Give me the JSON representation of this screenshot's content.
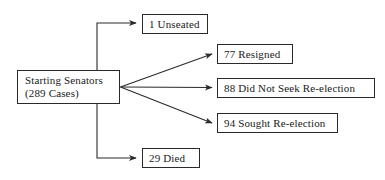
{
  "diagram": {
    "type": "flowchart",
    "orientation": "left-to-right",
    "line_color": "#2a2a2a",
    "box_border_color": "#2a2a2a",
    "background_color": "#ffffff",
    "source": {
      "id": "starting-senators",
      "line1": "Starting Senators",
      "line2": "(289 Cases)",
      "count": 289
    },
    "outcomes": [
      {
        "id": "unseated",
        "count": 1,
        "label": "1  Unseated",
        "route": "orthogonal-up"
      },
      {
        "id": "resigned",
        "count": 77,
        "label": "77  Resigned",
        "route": "diagonal-up"
      },
      {
        "id": "no-seek",
        "count": 88,
        "label": "88 Did Not Seek Re-election",
        "route": "straight"
      },
      {
        "id": "sought",
        "count": 94,
        "label": "94  Sought  Re-election",
        "route": "diagonal-down"
      },
      {
        "id": "died",
        "count": 29,
        "label": "29  Died",
        "route": "orthogonal-down"
      }
    ]
  }
}
